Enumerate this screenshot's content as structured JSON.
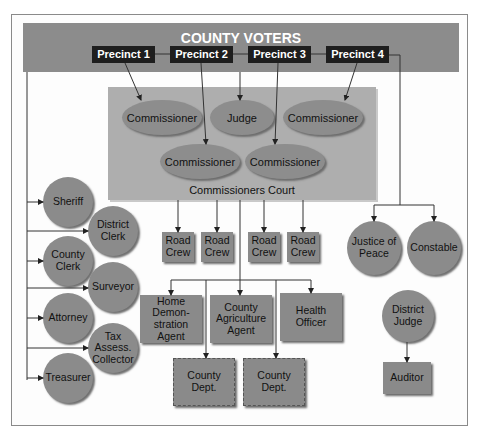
{
  "diagram": {
    "title": "COUNTY VOTERS",
    "precincts": [
      "Precinct 1",
      "Precinct 2",
      "Precinct 3",
      "Precinct 4"
    ],
    "commissioners_court": {
      "label": "Commissioners Court",
      "members": [
        "Commissioner",
        "Judge",
        "Commissioner",
        "Commissioner",
        "Commissioner"
      ]
    },
    "elected_officials_left": [
      "Sheriff",
      "District Clerk",
      "County Clerk",
      "Surveyor",
      "Attorney",
      "Tax Assess. Collector",
      "Treasurer"
    ],
    "road_crews": [
      "Road Crew",
      "Road Crew",
      "Road Crew",
      "Road Crew"
    ],
    "appointed_officials": [
      "Home Demon-stration Agent",
      "County Agriculture Agent",
      "Health Officer"
    ],
    "county_departments": [
      "County Dept.",
      "County Dept."
    ],
    "precinct_officials": [
      "Justice of Peace",
      "Constable"
    ],
    "district_judge": "District Judge",
    "auditor": "Auditor",
    "colors": {
      "banner": "#8c8c8c",
      "precinct_box": "#1e1e1e",
      "court_panel": "#aeaeae",
      "node_fill": "#8b8b8b",
      "line": "#333333"
    }
  }
}
